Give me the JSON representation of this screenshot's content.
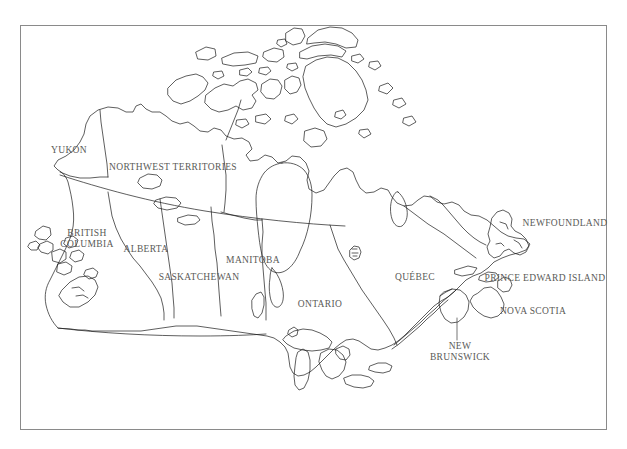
{
  "map": {
    "title": "Map of Canada (outline, provinces and territories)",
    "region": "Canada",
    "style": {
      "background_color": "#ffffff",
      "frame_color": "#8a8a8a",
      "coastline_color": "#1a1a1a",
      "border_color": "#3a3a3a",
      "label_color": "#5a5a57"
    },
    "frame": {
      "x": 20,
      "y": 25,
      "width": 587,
      "height": 405
    },
    "labels": [
      {
        "id": "yukon",
        "text": "YUKON",
        "x": 69,
        "y": 150,
        "lines": [
          "YUKON"
        ]
      },
      {
        "id": "northwest-territories",
        "text": "NORTHWEST TERRITORIES",
        "x": 173,
        "y": 167,
        "lines": [
          "NORTHWEST TERRITORIES"
        ]
      },
      {
        "id": "british-columbia",
        "text": "BRITISH COLUMBIA",
        "x": 87,
        "y": 238,
        "lines": [
          "BRITISH",
          "COLUMBIA"
        ]
      },
      {
        "id": "alberta",
        "text": "ALBERTA",
        "x": 146,
        "y": 249,
        "lines": [
          "ALBERTA"
        ]
      },
      {
        "id": "saskatchewan",
        "text": "SASKATCHEWAN",
        "x": 199,
        "y": 277,
        "lines": [
          "SASKATCHEWAN"
        ]
      },
      {
        "id": "manitoba",
        "text": "MANITOBA",
        "x": 253,
        "y": 260,
        "lines": [
          "MANITOBA"
        ]
      },
      {
        "id": "ontario",
        "text": "ONTARIO",
        "x": 320,
        "y": 304,
        "lines": [
          "ONTARIO"
        ]
      },
      {
        "id": "quebec",
        "text": "QUÉBEC",
        "x": 415,
        "y": 277,
        "lines": [
          "QUÉBEC"
        ]
      },
      {
        "id": "newfoundland",
        "text": "NEWFOUNDLAND",
        "x": 565,
        "y": 223,
        "lines": [
          "NEWFOUNDLAND"
        ]
      },
      {
        "id": "prince-edward-island",
        "text": "PRINCE EDWARD ISLAND",
        "x": 545,
        "y": 278,
        "lines": [
          "PRINCE EDWARD ISLAND"
        ]
      },
      {
        "id": "nova-scotia",
        "text": "NOVA SCOTIA",
        "x": 533,
        "y": 311,
        "lines": [
          "NOVA SCOTIA"
        ]
      },
      {
        "id": "new-brunswick",
        "text": "NEW BRUNSWICK",
        "x": 460,
        "y": 351,
        "lines": [
          "NEW",
          "BRUNSWICK"
        ]
      }
    ]
  }
}
